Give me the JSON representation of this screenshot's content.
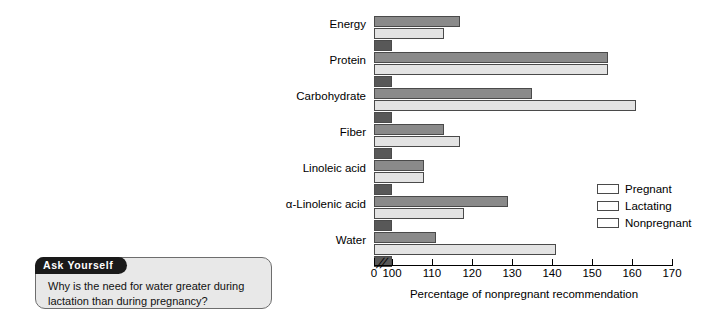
{
  "ask_yourself": {
    "tab_label": "Ask Yourself",
    "question": "Why is the need for water greater during lactation than during pregnancy?"
  },
  "chart_data": {
    "type": "bar",
    "orientation": "horizontal",
    "title": "",
    "xlabel": "Percentage of nonpregnant recommendation",
    "ylabel": "",
    "xlim": [
      100,
      170
    ],
    "axis_break": true,
    "axis_origin_label": "0",
    "grid": false,
    "legend_position": "right",
    "categories": [
      "Energy",
      "Protein",
      "Carbohydrate",
      "Fiber",
      "Linoleic acid",
      "α-Linolenic acid",
      "Water"
    ],
    "tick_labels": [
      "0",
      "100",
      "110",
      "120",
      "130",
      "140",
      "150",
      "160",
      "170"
    ],
    "tick_values": [
      0,
      100,
      110,
      120,
      130,
      140,
      150,
      160,
      170
    ],
    "series": [
      {
        "name": "Pregnant",
        "color": "#8a8a8a",
        "values": [
          117,
          154,
          135,
          113,
          108,
          129,
          111
        ]
      },
      {
        "name": "Lactating",
        "color": "#e3e3e3",
        "values": [
          113,
          154,
          161,
          117,
          108,
          118,
          141
        ]
      },
      {
        "name": "Nonpregnant",
        "color": "#585858",
        "values": [
          100,
          100,
          100,
          100,
          100,
          100,
          100
        ]
      }
    ]
  }
}
